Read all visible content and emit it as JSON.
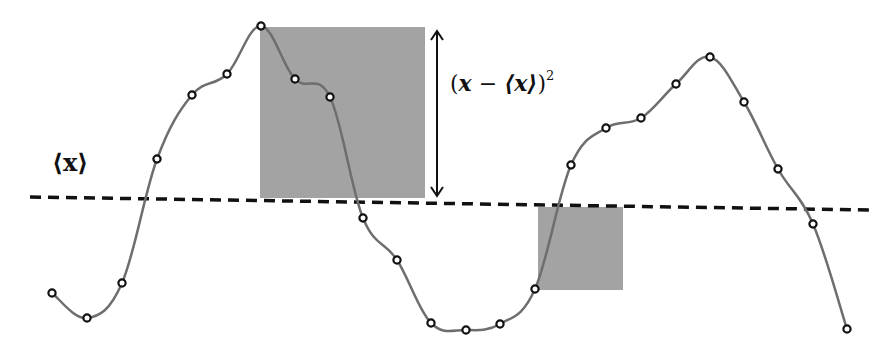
{
  "labels": {
    "mean": "⟨x⟩",
    "deviation_open": "(",
    "deviation_x": "x",
    "deviation_minus": " − ",
    "deviation_mean": "⟨x⟩",
    "deviation_close": ")",
    "deviation_power": "2"
  },
  "colors": {
    "curve": "#6e6e6e",
    "marker_stroke": "#111111",
    "marker_fill": "#ffffff",
    "square_fill": "#a3a3a3",
    "mean_line": "#111111",
    "arrow": "#111111"
  },
  "mean_line": {
    "x1": 30,
    "y1": 197,
    "x2": 870,
    "y2": 210
  },
  "points": [
    [
      52,
      293
    ],
    [
      87,
      318
    ],
    [
      122,
      283
    ],
    [
      157,
      159
    ],
    [
      192,
      95
    ],
    [
      227,
      74
    ],
    [
      261,
      26
    ],
    [
      295,
      79
    ],
    [
      330,
      97
    ],
    [
      363,
      218
    ],
    [
      397,
      260
    ],
    [
      431,
      323
    ],
    [
      466,
      330
    ],
    [
      500,
      324
    ],
    [
      535,
      289
    ],
    [
      571,
      165
    ],
    [
      606,
      128
    ],
    [
      641,
      118
    ],
    [
      676,
      84
    ],
    [
      710,
      57
    ],
    [
      744,
      102
    ],
    [
      778,
      169
    ],
    [
      813,
      224
    ],
    [
      847,
      329
    ]
  ],
  "squares": [
    {
      "name": "large-deviation-square",
      "x": 260,
      "y": 27,
      "w": 165,
      "h": 171
    },
    {
      "name": "small-deviation-square",
      "x": 538,
      "y": 207,
      "w": 85,
      "h": 83
    }
  ],
  "arrow": {
    "x": 437,
    "y1": 31,
    "y2": 196
  }
}
